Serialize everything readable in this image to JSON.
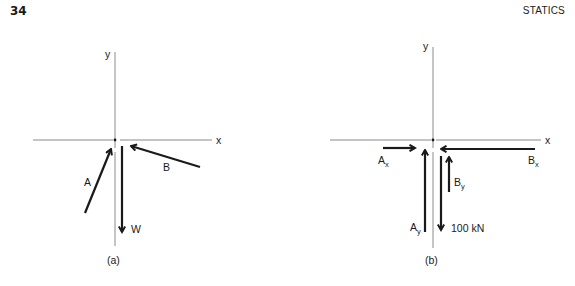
{
  "page": {
    "number": "34",
    "running_head": "STATICS"
  },
  "figure_a": {
    "caption": "(a)",
    "axis_x_label": "x",
    "axis_y_label": "y",
    "forces": [
      {
        "name": "A",
        "direction": "up-right toward origin"
      },
      {
        "name": "B",
        "direction": "up-left toward origin"
      },
      {
        "name": "W",
        "direction": "downward"
      }
    ],
    "labels": {
      "A": "A",
      "B": "B",
      "W": "W"
    }
  },
  "figure_b": {
    "caption": "(b)",
    "axis_x_label": "x",
    "axis_y_label": "y",
    "labels": {
      "Ax_main": "A",
      "Ax_sub": "x",
      "Ay_main": "A",
      "Ay_sub": "y",
      "Bx_main": "B",
      "Bx_sub": "x",
      "By_main": "B",
      "By_sub": "y",
      "load": "100 kN"
    }
  },
  "colors": {
    "axis": "#8a8a8a",
    "arrow": "#1a1a1a"
  }
}
